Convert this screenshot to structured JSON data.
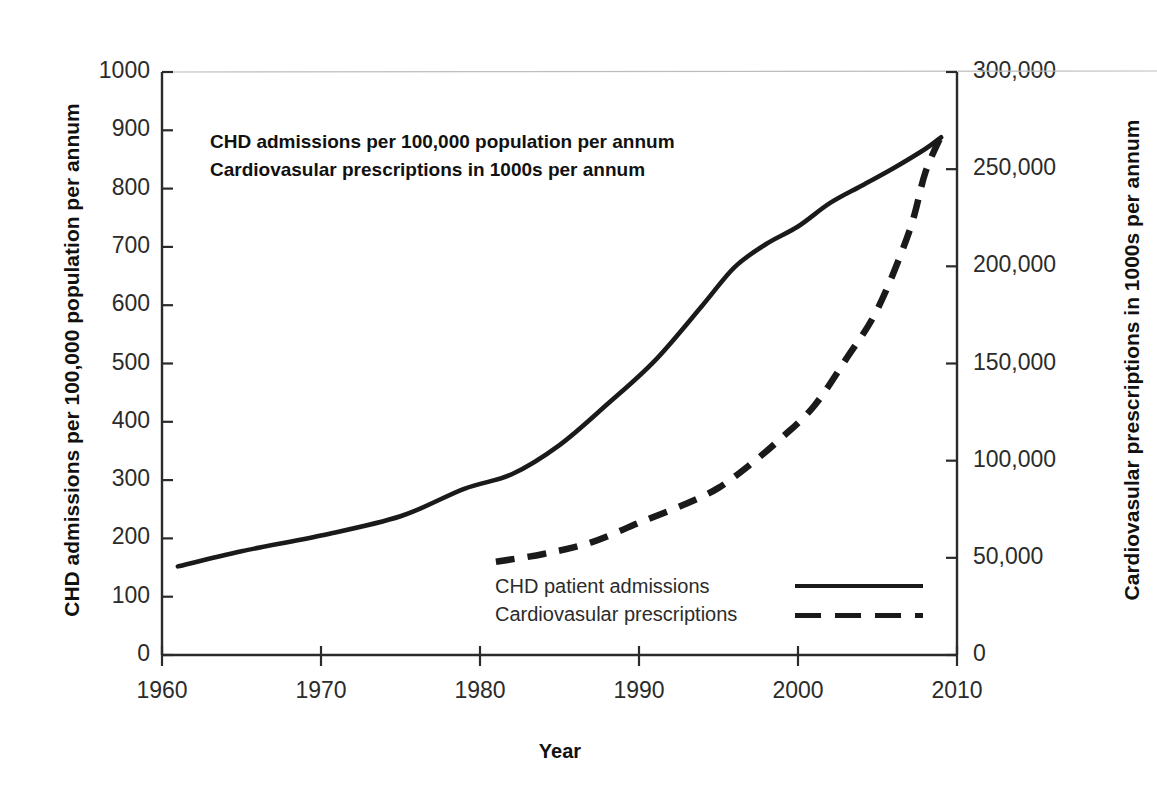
{
  "figure": {
    "clipped_top_text": "partially cropped caption line",
    "annotation_lines": [
      "CHD admissions per 100,000 population per annum",
      "Cardiovasular prescriptions in 1000s per annum"
    ]
  },
  "chart_data": {
    "type": "line",
    "title": "",
    "xlabel": "Year",
    "ylabel": "CHD admissions per 100,000 population per annum",
    "y2label": "Cardiovasular prescriptions in 1000s per annum",
    "xlim": [
      1960,
      2010
    ],
    "ylim": [
      0,
      1000
    ],
    "y2lim": [
      0,
      300000
    ],
    "xticks": [
      1960,
      1970,
      1980,
      1990,
      2000,
      2010
    ],
    "xtick_labels": [
      "1960",
      "1970",
      "1980",
      "1990",
      "2000",
      "2010"
    ],
    "yticks": [
      0,
      100,
      200,
      300,
      400,
      500,
      600,
      700,
      800,
      900,
      1000
    ],
    "ytick_labels": [
      "0",
      "100",
      "200",
      "300",
      "400",
      "500",
      "600",
      "700",
      "800",
      "900",
      "1000"
    ],
    "y2ticks": [
      0,
      50000,
      100000,
      150000,
      200000,
      250000,
      300000
    ],
    "y2tick_labels": [
      "0",
      "50,000",
      "100,000",
      "150,000",
      "200,000",
      "250,000",
      "300,000"
    ],
    "grid": false,
    "legend_position": "inside lower-center",
    "series": [
      {
        "name": "CHD patient admissions",
        "axis": "left",
        "style": "solid",
        "color": "#1a1a1a",
        "x": [
          1961,
          1965,
          1970,
          1975,
          1979,
          1982,
          1985,
          1988,
          1991,
          1994,
          1996,
          1998,
          2000,
          2002,
          2004,
          2006,
          2008,
          2009
        ],
        "y": [
          152,
          178,
          205,
          238,
          285,
          310,
          360,
          430,
          505,
          600,
          665,
          705,
          735,
          775,
          805,
          835,
          868,
          888
        ]
      },
      {
        "name": "Cardiovasular prescriptions",
        "axis": "right",
        "style": "dashed",
        "color": "#1a1a1a",
        "x": [
          1981,
          1984,
          1987,
          1990,
          1993,
          1995,
          1997,
          1999,
          2001,
          2003,
          2005,
          2007,
          2008,
          2009
        ],
        "y": [
          48000,
          52000,
          58000,
          68000,
          78000,
          86000,
          98000,
          112000,
          128000,
          152000,
          178000,
          218000,
          248000,
          267000
        ]
      }
    ]
  },
  "legend": {
    "items": [
      {
        "label": "CHD patient admissions",
        "style": "solid"
      },
      {
        "label": "Cardiovasular prescriptions",
        "style": "dashed"
      }
    ]
  }
}
